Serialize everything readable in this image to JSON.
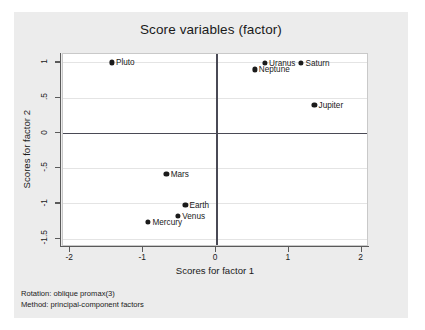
{
  "chart_data": {
    "type": "scatter",
    "title": "Score variables (factor)",
    "xlabel": "Scores for factor 1",
    "ylabel": "Scores for factor 2",
    "xlim": [
      -2.1,
      2.1
    ],
    "ylim": [
      -1.62,
      1.12
    ],
    "xticks": [
      "-2",
      "-1",
      "0",
      "1",
      "2"
    ],
    "xtick_values": [
      -2,
      -1,
      0,
      1,
      2
    ],
    "yticks": [
      "1",
      ".5",
      "0",
      "-.5",
      "-1",
      "-1.5"
    ],
    "ytick_values": [
      1,
      0.5,
      0,
      -0.5,
      -1,
      -1.5
    ],
    "grid": "horizontal",
    "legend": "none",
    "reference_lines": {
      "x": 0,
      "y": 0
    },
    "points": [
      {
        "label": "Pluto",
        "x": -1.43,
        "y": 1.0,
        "label_side": "right"
      },
      {
        "label": "Uranus",
        "x": 0.67,
        "y": 0.99,
        "label_side": "right"
      },
      {
        "label": "Saturn",
        "x": 1.17,
        "y": 0.99,
        "label_side": "right"
      },
      {
        "label": "Neptune",
        "x": 0.53,
        "y": 0.9,
        "label_side": "right"
      },
      {
        "label": "Jupiter",
        "x": 1.35,
        "y": 0.4,
        "label_side": "right"
      },
      {
        "label": "Mars",
        "x": -0.68,
        "y": -0.58,
        "label_side": "right"
      },
      {
        "label": "Earth",
        "x": -0.42,
        "y": -1.02,
        "label_side": "right"
      },
      {
        "label": "Venus",
        "x": -0.52,
        "y": -1.18,
        "label_side": "right"
      },
      {
        "label": "Mercury",
        "x": -0.93,
        "y": -1.26,
        "label_side": "right"
      }
    ]
  },
  "footnotes": {
    "rotation": "Rotation: oblique promax(3)",
    "method": "Method: principal-component factors"
  }
}
